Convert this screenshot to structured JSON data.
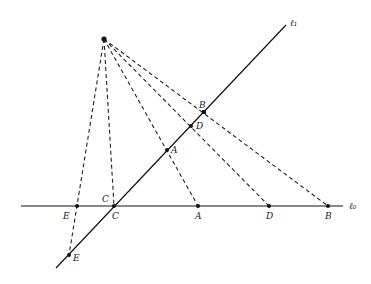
{
  "diagram": {
    "lines": {
      "l1": {
        "label": "ℓ₁",
        "from": [
          56,
          268
        ],
        "to": [
          286,
          25
        ]
      },
      "l0": {
        "label": "ℓ₀",
        "from": [
          21,
          206
        ],
        "to": [
          343,
          206
        ]
      }
    },
    "center": {
      "x": 104,
      "y": 39
    },
    "points_l1": [
      {
        "name": "B",
        "x": 204,
        "y": 112
      },
      {
        "name": "D",
        "x": 191,
        "y": 126
      },
      {
        "name": "A",
        "x": 167,
        "y": 150
      },
      {
        "name": "C",
        "x": 114,
        "y": 206
      },
      {
        "name": "E",
        "x": 69,
        "y": 255
      }
    ],
    "points_l0": [
      {
        "name": "E",
        "x": 77,
        "y": 206
      },
      {
        "name": "C",
        "x": 114,
        "y": 206
      },
      {
        "name": "A",
        "x": 198,
        "y": 206
      },
      {
        "name": "D",
        "x": 269,
        "y": 206
      },
      {
        "name": "B",
        "x": 328,
        "y": 206
      }
    ],
    "labels": {
      "l1": "ℓ₁",
      "l0": "ℓ₀",
      "B_top": "B",
      "D_top": "D",
      "A_top": "A",
      "C_top": "C",
      "E_bottom": "E",
      "E_base": "E",
      "C_base": "C",
      "A_base": "A",
      "D_base": "D",
      "B_base": "B"
    },
    "colors": {
      "line": "#111111",
      "dash": "#222222"
    }
  }
}
